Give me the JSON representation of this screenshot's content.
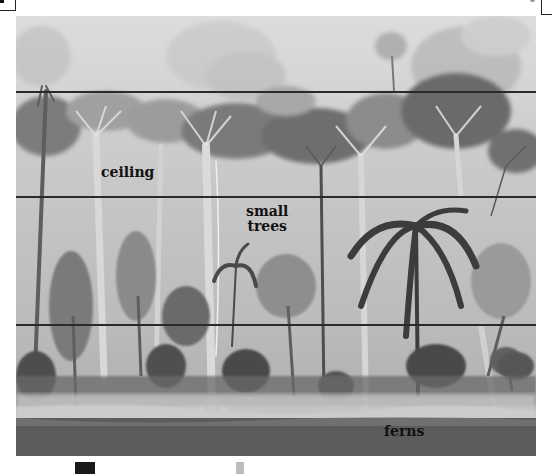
{
  "figure": {
    "layers": [
      {
        "name": "emergent",
        "label": ""
      },
      {
        "name": "ceiling",
        "label": "ceiling"
      },
      {
        "name": "small_trees",
        "label": "small\ntrees",
        "label_line1": "small",
        "label_line2": "trees"
      },
      {
        "name": "undergrowth",
        "label": ""
      },
      {
        "name": "ferns",
        "label": "ferns"
      }
    ],
    "divider_lines_y": [
      91,
      196,
      324
    ],
    "colors": {
      "sky": "#dcdcdc",
      "lines": "#2a2a2a",
      "ground": "#5c5c5c",
      "text": "#111111"
    }
  },
  "labels": {
    "ceiling": "ceiling",
    "small_trees_line1": "small",
    "small_trees_line2": "trees",
    "ferns": "ferns"
  }
}
